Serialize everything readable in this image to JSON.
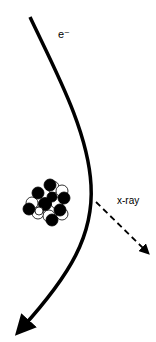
{
  "diagram": {
    "electron_label": "e⁻",
    "xray_label": "x-ray",
    "colors": {
      "line": "#000000",
      "background": "#ffffff",
      "proton": "#000000",
      "neutron": "#ffffff"
    },
    "elements": [
      {
        "name": "electron-path",
        "description": "curved electron trajectory with arrowhead at bottom-left"
      },
      {
        "name": "nucleus",
        "description": "cluster of black and white spheres (protons and neutrons)"
      },
      {
        "name": "xray-photon",
        "description": "dashed arrow emitted toward lower right"
      }
    ]
  }
}
